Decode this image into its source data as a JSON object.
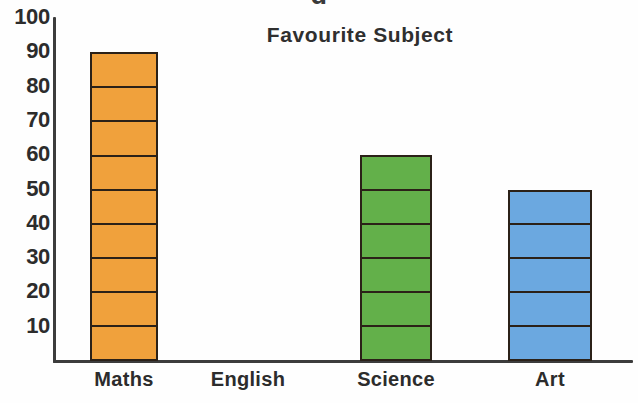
{
  "header": {
    "clipped_text": "g"
  },
  "chart_data": {
    "type": "bar",
    "title": "Favourite Subject",
    "xlabel": "",
    "ylabel": "",
    "categories": [
      "Maths",
      "English",
      "Science",
      "Art"
    ],
    "values": [
      90,
      0,
      60,
      50
    ],
    "colors": [
      "#f0a13c",
      "#f0a13c",
      "#63b04a",
      "#6ba8e0"
    ],
    "series": [
      {
        "name": "Favourite Subject",
        "values": [
          90,
          0,
          60,
          50
        ]
      }
    ],
    "ylim": [
      0,
      100
    ],
    "ytick_labels": [
      "100",
      "90",
      "80",
      "70",
      "60",
      "50",
      "40",
      "30",
      "20",
      "10"
    ],
    "ytick_values": [
      100,
      90,
      80,
      70,
      60,
      50,
      40,
      30,
      20,
      10
    ],
    "ytick_step": 10,
    "segment_size": 10,
    "grid": false,
    "legend": false,
    "outline_color": "#2b2118",
    "axis_color": "#3c3c3c",
    "background": "#ffffff"
  }
}
